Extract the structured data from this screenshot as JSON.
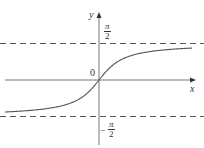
{
  "chart_data": {
    "type": "line",
    "title": "",
    "function": "y = arctan(x)",
    "xlabel": "x",
    "ylabel": "y",
    "origin_label": "0",
    "asymptotes": [
      {
        "y": 1.5708,
        "label_num": "π",
        "label_den": "2",
        "label": "π/2",
        "style": "dashed"
      },
      {
        "y": -1.5708,
        "label_num": "π",
        "label_den": "2",
        "label": "−π/2",
        "sign": "−",
        "style": "dashed"
      }
    ],
    "series": [
      {
        "name": "arctan",
        "x": [
          -5,
          -4,
          -3,
          -2,
          -1,
          -0.5,
          0,
          0.5,
          1,
          2,
          3,
          4,
          5
        ],
        "values": [
          -1.373,
          -1.326,
          -1.249,
          -1.107,
          -0.785,
          -0.464,
          0,
          0.464,
          0.785,
          1.107,
          1.249,
          1.326,
          1.373
        ]
      }
    ],
    "grid": false,
    "legend": "none",
    "xlim": [
      -5.2,
      5.2
    ],
    "ylim": [
      -2.1,
      2.1
    ],
    "colors": {
      "curve": "#555555",
      "axis": "#555555",
      "asymptote": "#444444"
    }
  }
}
